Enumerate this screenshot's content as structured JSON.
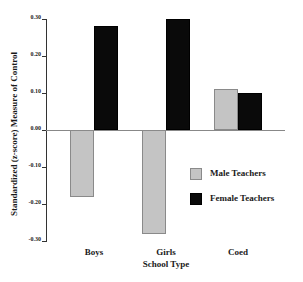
{
  "chart_data": {
    "type": "bar",
    "title": "",
    "xlabel": "School Type",
    "ylabel": "Standardized (z-score) Measure of Control",
    "categories": [
      "Boys",
      "Girls",
      "Coed"
    ],
    "series": [
      {
        "name": "Male Teachers",
        "color": "#c4c4c4",
        "values": [
          -0.18,
          -0.28,
          0.11
        ]
      },
      {
        "name": "Female Teachers",
        "color": "#0a0a0a",
        "values": [
          0.28,
          0.3,
          0.1
        ]
      }
    ],
    "ylim": [
      -0.3,
      0.3
    ],
    "yticks": [
      "0.30",
      "0.20",
      "0.10",
      "0.00",
      "-0.10",
      "-0.20",
      "-0.30"
    ],
    "ytick_values": [
      0.3,
      0.2,
      0.1,
      0.0,
      -0.1,
      -0.2,
      -0.3
    ],
    "grid": false,
    "legend_position": "lower right inside plot"
  },
  "legend": {
    "male_label": "Male Teachers",
    "female_label": "Female Teachers"
  }
}
